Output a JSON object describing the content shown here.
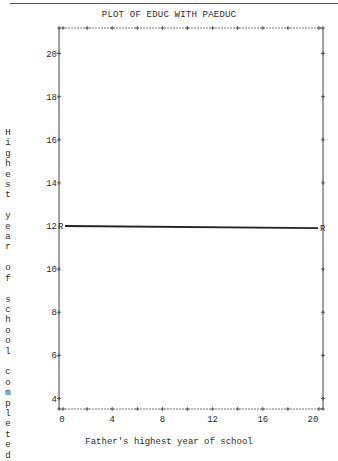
{
  "chart_data": {
    "type": "line",
    "title": "PLOT OF EDUC WITH PAEDUC",
    "xlabel": "Father's highest year of school",
    "ylabel": "Highest year of school completed",
    "x_ticks": [
      0,
      4,
      8,
      12,
      16,
      20
    ],
    "y_ticks": [
      4,
      6,
      8,
      10,
      12,
      14,
      16,
      18,
      20
    ],
    "xlim": [
      -0.2,
      20.6
    ],
    "ylim": [
      3.4,
      21.2
    ],
    "grid": false,
    "series": [
      {
        "name": "Regression line (R)",
        "marker": "R",
        "x": [
          0,
          20.5
        ],
        "y": [
          12.0,
          11.9
        ]
      }
    ]
  },
  "labels": {
    "title": "PLOT OF EDUC WITH PAEDUC",
    "xlabel": "Father's highest year of school",
    "ylabel_vertical": "H\ni\ng\nh\ne\ns\nt\n\ny\ne\na\nr\n\no\nf\n\ns\nc\nh\no\no\nl\n\nc\no\nm\np\nl\ne\nt\ne\nd",
    "marker_left": "R",
    "marker_right": "R"
  }
}
